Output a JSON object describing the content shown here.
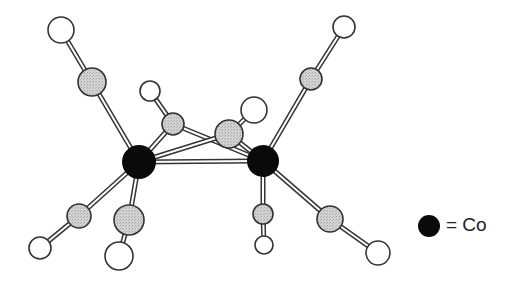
{
  "diagram": {
    "type": "ball-and-stick molecular structure",
    "colors": {
      "cobalt": "#0a0a0a",
      "carbon": "#cfcfcf",
      "terminal": "#ffffff",
      "outline": "#333333",
      "bond_fill": "#ffffff"
    },
    "atoms": [
      {
        "id": "Co1",
        "kind": "cobalt",
        "x": 139,
        "y": 162,
        "r": 17
      },
      {
        "id": "Co2",
        "kind": "cobalt",
        "x": 263,
        "y": 161,
        "r": 16
      },
      {
        "id": "C_tl",
        "kind": "carbon",
        "x": 92,
        "y": 82,
        "r": 14
      },
      {
        "id": "O_tl",
        "kind": "terminal",
        "x": 61,
        "y": 30,
        "r": 13
      },
      {
        "id": "C_tr",
        "kind": "carbon",
        "x": 311,
        "y": 79,
        "r": 11
      },
      {
        "id": "O_tr",
        "kind": "terminal",
        "x": 344,
        "y": 27,
        "r": 11
      },
      {
        "id": "C_b1",
        "kind": "carbon",
        "x": 173,
        "y": 124,
        "r": 11
      },
      {
        "id": "H_b1",
        "kind": "terminal",
        "x": 150,
        "y": 91,
        "r": 10
      },
      {
        "id": "C_b2",
        "kind": "carbon",
        "x": 229,
        "y": 134,
        "r": 14
      },
      {
        "id": "H_b2",
        "kind": "terminal",
        "x": 254,
        "y": 110,
        "r": 13
      },
      {
        "id": "C_ll",
        "kind": "carbon",
        "x": 79,
        "y": 216,
        "r": 12
      },
      {
        "id": "O_ll",
        "kind": "terminal",
        "x": 40,
        "y": 248,
        "r": 11
      },
      {
        "id": "C_lm",
        "kind": "carbon",
        "x": 129,
        "y": 220,
        "r": 15
      },
      {
        "id": "O_lm",
        "kind": "terminal",
        "x": 119,
        "y": 256,
        "r": 14
      },
      {
        "id": "C_rm",
        "kind": "carbon",
        "x": 263,
        "y": 214,
        "r": 10
      },
      {
        "id": "O_rm",
        "kind": "terminal",
        "x": 264,
        "y": 245,
        "r": 9
      },
      {
        "id": "C_rr",
        "kind": "carbon",
        "x": 330,
        "y": 219,
        "r": 13
      },
      {
        "id": "O_rr",
        "kind": "terminal",
        "x": 378,
        "y": 253,
        "r": 12
      }
    ],
    "bonds": [
      [
        "Co1",
        "Co2"
      ],
      [
        "Co1",
        "C_tl"
      ],
      [
        "C_tl",
        "O_tl"
      ],
      [
        "Co2",
        "C_tr"
      ],
      [
        "C_tr",
        "O_tr"
      ],
      [
        "Co1",
        "C_b1"
      ],
      [
        "C_b1",
        "H_b1"
      ],
      [
        "C_b1",
        "Co2"
      ],
      [
        "Co1",
        "C_b2"
      ],
      [
        "C_b2",
        "Co2"
      ],
      [
        "C_b2",
        "H_b2"
      ],
      [
        "Co1",
        "C_ll"
      ],
      [
        "C_ll",
        "O_ll"
      ],
      [
        "Co1",
        "C_lm"
      ],
      [
        "C_lm",
        "O_lm"
      ],
      [
        "Co2",
        "C_rm"
      ],
      [
        "C_rm",
        "O_rm"
      ],
      [
        "Co2",
        "C_rr"
      ],
      [
        "C_rr",
        "O_rr"
      ]
    ]
  },
  "legend": {
    "symbol": "cobalt",
    "label": "= Co"
  }
}
